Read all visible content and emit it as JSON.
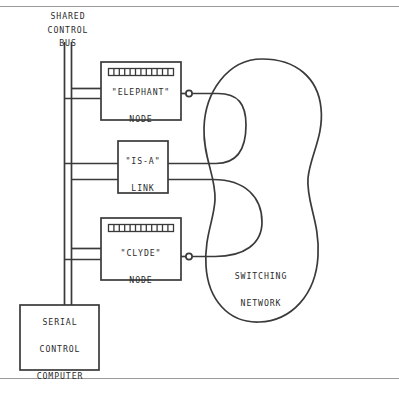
{
  "figure": {
    "type": "block-diagram",
    "page_rules": {
      "top_rule_y": 6,
      "bottom_rule_y": 378
    }
  },
  "labels": {
    "shared_control_bus": "SHARED\nCONTROL\nBUS",
    "elephant_node": "\"ELEPHANT\"\n\nNODE",
    "isa_link": "\"IS-A\"\n\nLINK",
    "clyde_node": "\"CLYDE\"\n\nNODE",
    "serial_control_computer": "SERIAL\n\nCONTROL\n\nCOMPUTER",
    "switching_network": "SWITCHING\n\nNETWORK"
  },
  "boxes": [
    {
      "name": "elephant-node",
      "label": "\"ELEPHANT\" NODE",
      "x": 101,
      "y": 62,
      "width": 80,
      "height": 58,
      "register_bar": {
        "cells": 12,
        "x": 108,
        "y": 68,
        "width": 66,
        "height": 7
      }
    },
    {
      "name": "isa-link",
      "label": "\"IS-A\" LINK",
      "x": 118,
      "y": 141,
      "width": 50,
      "height": 52,
      "register_bar": null
    },
    {
      "name": "clyde-node",
      "label": "\"CLYDE\" NODE",
      "x": 101,
      "y": 218,
      "width": 80,
      "height": 62,
      "register_bar": {
        "cells": 12,
        "x": 108,
        "y": 224,
        "width": 66,
        "height": 7
      }
    },
    {
      "name": "serial-control-computer",
      "label": "SERIAL CONTROL COMPUTER",
      "x": 20,
      "y": 305,
      "width": 79,
      "height": 65,
      "register_bar": null
    }
  ],
  "bus": {
    "name": "shared-control-bus",
    "orientation": "vertical",
    "line_count": 2,
    "x_left": 64,
    "x_right": 71,
    "y_top": 48,
    "y_bottom": 305,
    "stub_top_y": 42,
    "branches": [
      {
        "target": "elephant-node",
        "y_upper": 88,
        "y_lower": 98
      },
      {
        "target": "isa-link",
        "y_upper": 163,
        "y_lower": 179
      },
      {
        "target": "clyde-node",
        "y_upper": 248,
        "y_lower": 259
      }
    ]
  },
  "terminals": [
    {
      "name": "elephant-output-terminal",
      "x": 189,
      "y": 93,
      "radius": 3.2
    },
    {
      "name": "clyde-output-terminal",
      "x": 189,
      "y": 256,
      "radius": 3.2
    }
  ],
  "switching_network": {
    "name": "switching-network",
    "shape": "amoeba-blob",
    "label": "SWITCHING NETWORK",
    "bounds": {
      "x": 205,
      "y": 58,
      "width": 115,
      "height": 265
    },
    "internal_paths": [
      {
        "name": "upper-u-turn",
        "from": "elephant-output-terminal",
        "to": "isa-link-upper-port"
      },
      {
        "name": "lower-u-turn",
        "from": "isa-link-lower-port",
        "to": "clyde-output-terminal"
      }
    ]
  },
  "colors": {
    "ink": "#2b2b2b",
    "line": "#3a3a3a",
    "rule": "#9a9a9a",
    "paper": "#ffffff"
  }
}
